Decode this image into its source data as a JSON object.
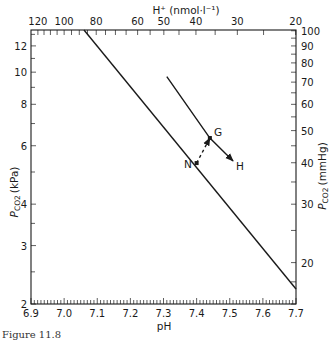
{
  "chart_data": {
    "type": "line",
    "title": "",
    "xlabel": "pH",
    "ylabel": "PCO2 (kPa)",
    "ylabel_right": "PCO2 (mmHg)",
    "xlabel_top": "H+ (nmol·l⁻¹)",
    "xlim": [
      6.9,
      7.7
    ],
    "ylim": [
      2,
      13.4
    ],
    "yscale": "log",
    "grid": false,
    "x_ticks": [
      "6.9",
      "7.0",
      "7.1",
      "7.2",
      "7.3",
      "7.4",
      "7.5",
      "7.6",
      "7.7"
    ],
    "y_ticks_left": [
      "2",
      "3",
      "4",
      "6",
      "8",
      "10",
      "12"
    ],
    "y_ticks_right": [
      "20",
      "30",
      "40",
      "50",
      "60",
      "70",
      "80",
      "90",
      "100"
    ],
    "x_ticks_top": [
      "120",
      "100",
      "80",
      "60",
      "50",
      "40",
      "30",
      "20"
    ],
    "series": [
      {
        "name": "Normal buffer line",
        "style": "solid",
        "points": [
          {
            "pH": 7.06,
            "kPa": 13.4
          },
          {
            "pH": 7.7,
            "kPa": 2.22
          }
        ]
      },
      {
        "name": "Shifted buffer line (G to H)",
        "style": "solid-arrow",
        "points": [
          {
            "pH": 7.31,
            "kPa": 9.7
          },
          {
            "pH": 7.44,
            "kPa": 6.33
          },
          {
            "pH": 7.51,
            "kPa": 5.4
          }
        ]
      },
      {
        "name": "N to G transition",
        "style": "dashed-arrow",
        "points": [
          {
            "pH": 7.4,
            "kPa": 5.32
          },
          {
            "pH": 7.44,
            "kPa": 6.33
          }
        ]
      }
    ],
    "annotations": [
      {
        "label": "N",
        "pH": 7.4,
        "kPa": 5.32
      },
      {
        "label": "G",
        "pH": 7.44,
        "kPa": 6.33
      },
      {
        "label": "H",
        "pH": 7.51,
        "kPa": 5.4
      }
    ]
  },
  "labels": {
    "top_axis_title": "H⁺ (nmol·l⁻¹)",
    "left_axis_title_main": "P",
    "left_axis_title_sub": "CO2",
    "left_axis_title_unit": "(kPa)",
    "right_axis_title_main": "P",
    "right_axis_title_sub": "CO2",
    "right_axis_title_unit": "(mmHg)",
    "bottom_axis_title": "pH",
    "point_n": "N",
    "point_g": "G",
    "point_h": "H",
    "caption": "Figure 11.8"
  },
  "colors": {
    "ink": "#1a1a1a",
    "background": "#ffffff"
  }
}
